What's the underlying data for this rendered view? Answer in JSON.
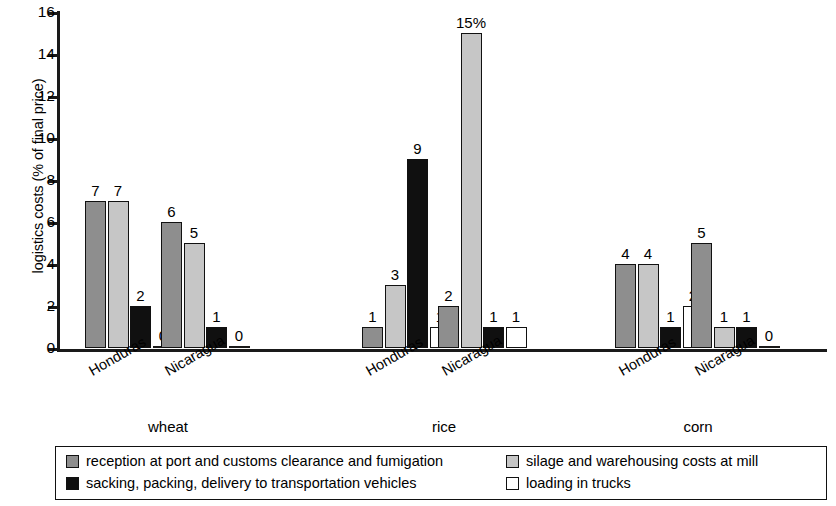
{
  "chart_data": {
    "type": "bar",
    "title": "",
    "xlabel": "",
    "ylabel": "logistics costs (% of final price)",
    "ylim": [
      0,
      16
    ],
    "ytick_labels": [
      "0",
      "2",
      "4",
      "6",
      "8",
      "10",
      "12",
      "14",
      "16"
    ],
    "ytick_values": [
      0,
      2,
      4,
      6,
      8,
      10,
      12,
      14,
      16
    ],
    "grid": false,
    "legend_position": "bottom",
    "groups": [
      "wheat",
      "rice",
      "corn"
    ],
    "categories": [
      "wheat / Honduras",
      "wheat / Nicaragua",
      "rice / Honduras",
      "rice / Nicaragua",
      "corn / Honduras",
      "corn / Nicaragua"
    ],
    "series": [
      {
        "name": "reception at port and customs clearance and fumigation",
        "color": "#8e8e8e",
        "values": [
          7,
          6,
          1,
          2,
          4,
          5
        ]
      },
      {
        "name": "silage and warehousing costs at mill",
        "color": "#c6c6c6",
        "values": [
          7,
          5,
          3,
          15,
          4,
          1
        ]
      },
      {
        "name": "sacking, packing, delivery to transportation vehicles",
        "color": "#101010",
        "values": [
          2,
          1,
          9,
          1,
          1,
          1
        ]
      },
      {
        "name": "loading in trucks",
        "color": "#ffffff",
        "values": [
          0,
          0,
          1,
          1,
          2,
          0
        ]
      }
    ],
    "data_labels": [
      [
        "7",
        "6",
        "1",
        "2",
        "4",
        "5"
      ],
      [
        "7",
        "5",
        "3",
        "15%",
        "4",
        "1"
      ],
      [
        "2",
        "1",
        "9",
        "1",
        "1",
        "1"
      ],
      [
        "0",
        "0",
        "1",
        "1",
        "2",
        "0"
      ]
    ],
    "cluster_labels": [
      "Honduras",
      "Nicaragua",
      "Honduras",
      "Nicaragua",
      "Honduras",
      "Nicaragua"
    ]
  },
  "legend": {
    "items": [
      {
        "label": "reception at port and customs clearance and fumigation",
        "swatch": "s0"
      },
      {
        "label": "sacking, packing, delivery to transportation vehicles",
        "swatch": "s2"
      },
      {
        "label": "silage and warehousing costs at mill",
        "swatch": "s1"
      },
      {
        "label": "loading in trucks",
        "swatch": "s3"
      }
    ]
  }
}
